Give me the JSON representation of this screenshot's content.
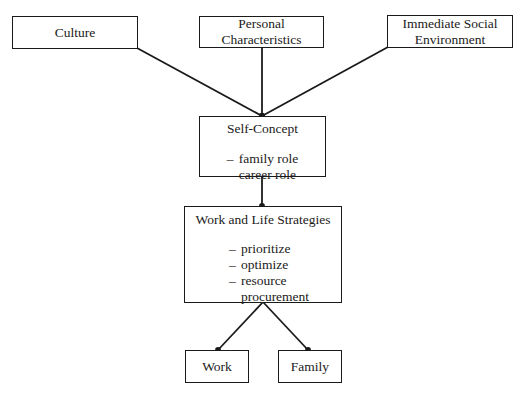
{
  "diagram": {
    "type": "flowchart",
    "nodes": {
      "culture": {
        "label": "Culture"
      },
      "personal": {
        "label_lines": [
          "Personal",
          "Characteristics"
        ]
      },
      "immediate": {
        "label_lines": [
          "Immediate Social",
          "Environment"
        ]
      },
      "self_concept": {
        "label": "Self-Concept",
        "items": [
          "family role",
          "career role"
        ]
      },
      "strategies": {
        "label": "Work and Life Strategies",
        "items": [
          "prioritize",
          "optimize",
          "resource"
        ],
        "item_continuation": "procurement"
      },
      "work": {
        "label": "Work"
      },
      "family": {
        "label": "Family"
      }
    },
    "bullet": "–",
    "edges": [
      {
        "from": "Culture",
        "to": "Self-Concept"
      },
      {
        "from": "Personal Characteristics",
        "to": "Self-Concept"
      },
      {
        "from": "Immediate Social Environment",
        "to": "Self-Concept"
      },
      {
        "from": "Self-Concept",
        "to": "Work and Life Strategies"
      },
      {
        "from": "Work and Life Strategies",
        "to": "Work"
      },
      {
        "from": "Work and Life Strategies",
        "to": "Family"
      }
    ],
    "line_color": "#1a1a1a"
  }
}
